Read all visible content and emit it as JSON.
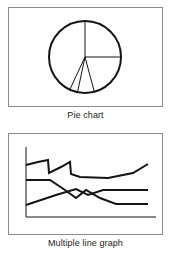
{
  "page": {
    "background": "#ffffff",
    "width": 171,
    "height": 257,
    "ink_color": "#141414",
    "frame_color": "#8c8c8c"
  },
  "figures": [
    {
      "id": "pie",
      "caption": "Pie chart",
      "chart_data": {
        "type": "pie",
        "title": "Pie chart",
        "style": "outline-only",
        "fill": "none",
        "stroke": "#141414",
        "center": [
          77,
          50
        ],
        "radius": 36,
        "labels": [],
        "legend": "none",
        "grid": false,
        "slices": [
          {
            "name": "slice-1",
            "start_deg": 0,
            "end_deg": 90,
            "value": 25
          },
          {
            "name": "slice-2",
            "start_deg": 90,
            "end_deg": 165,
            "value": 21
          },
          {
            "name": "slice-3",
            "start_deg": 165,
            "end_deg": 192,
            "value": 7
          },
          {
            "name": "slice-4",
            "start_deg": 192,
            "end_deg": 205,
            "value": 4
          },
          {
            "name": "slice-5",
            "start_deg": 205,
            "end_deg": 360,
            "value": 43
          }
        ],
        "values": [
          25,
          21,
          7,
          4,
          43
        ]
      }
    },
    {
      "id": "line",
      "caption": "Multiple line graph",
      "chart_data": {
        "type": "line",
        "title": "Multiple line graph",
        "style": "outline-only",
        "stroke": "#141414",
        "xlabel": "",
        "ylabel": "",
        "grid": false,
        "legend": "none",
        "tick_labels": {
          "x": [],
          "y": []
        },
        "axes": {
          "x_axis": [
            18,
            84,
            148,
            84
          ],
          "y_axis": [
            18,
            14,
            18,
            84
          ]
        },
        "series": [
          {
            "name": "series-1-jagged-top",
            "points": [
              [
                18,
                32
              ],
              [
                30,
                29
              ],
              [
                40,
                27
              ],
              [
                41,
                40
              ],
              [
                53,
                34
              ],
              [
                62,
                29
              ],
              [
                63,
                41
              ],
              [
                72,
                44
              ],
              [
                100,
                45
              ],
              [
                125,
                40
              ],
              [
                140,
                31
              ]
            ]
          },
          {
            "name": "series-2-descending",
            "points": [
              [
                18,
                47
              ],
              [
                42,
                47
              ],
              [
                57,
                57
              ],
              [
                68,
                65
              ],
              [
                78,
                57
              ],
              [
                92,
                65
              ],
              [
                108,
                71
              ],
              [
                140,
                71
              ]
            ]
          },
          {
            "name": "series-3-ascending",
            "points": [
              [
                18,
                72
              ],
              [
                48,
                62
              ],
              [
                68,
                56
              ],
              [
                80,
                62
              ],
              [
                95,
                57
              ],
              [
                128,
                57
              ],
              [
                140,
                57
              ]
            ]
          }
        ]
      }
    }
  ]
}
